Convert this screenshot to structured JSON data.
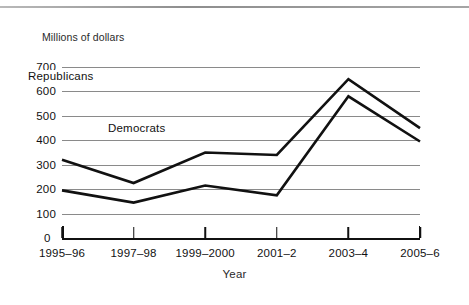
{
  "figure": {
    "y_axis_title": "Millions of dollars",
    "x_axis_title": "Year",
    "zero_label": "0"
  },
  "chart_data": {
    "type": "line",
    "title": "",
    "subtitle": "",
    "xlabel": "Year",
    "ylabel": "Millions of dollars",
    "categories": [
      "1995–96",
      "1997–98",
      "1999–2000",
      "2001–2",
      "2003–4",
      "2005–6"
    ],
    "series": [
      {
        "name": "Republicans",
        "values": [
          320,
          225,
          350,
          340,
          650,
          450
        ]
      },
      {
        "name": "Democrats",
        "values": [
          195,
          145,
          215,
          175,
          580,
          395
        ]
      }
    ],
    "ylim": [
      0,
      700
    ],
    "ytick_labels": [
      "0",
      "100",
      "200",
      "300",
      "400",
      "500",
      "600",
      "700"
    ],
    "ytick_values": [
      0,
      100,
      200,
      300,
      400,
      500,
      600,
      700
    ],
    "grid": "horizontal",
    "legend": "inline-labels",
    "annotations": [
      {
        "text": "Republicans",
        "near_series": "Republicans"
      },
      {
        "text": "Democrats",
        "near_series": "Democrats"
      }
    ],
    "colors": {
      "line": "#111111",
      "grid": "#8a8a8a",
      "axis": "#111111",
      "background": "#ffffff"
    }
  }
}
